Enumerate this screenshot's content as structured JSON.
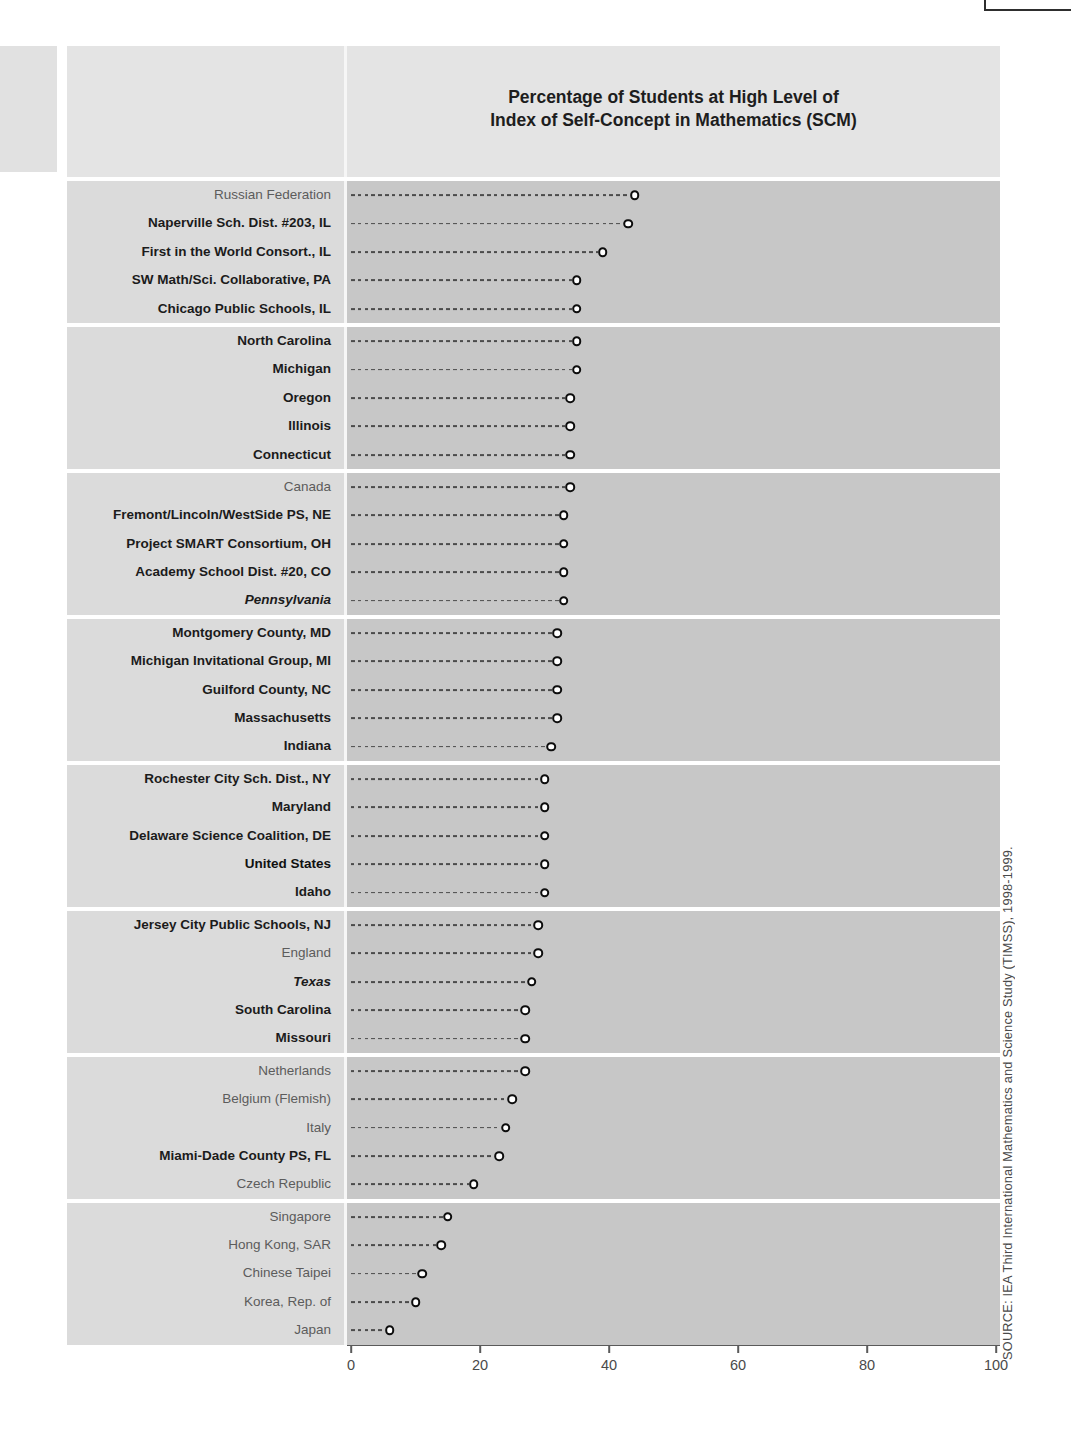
{
  "page": {
    "title_lines": [
      "Percentage of Students at High Level of",
      "Index of Self-Concept in Mathematics (SCM)"
    ],
    "source_note": "SOURCE: IEA Third International Mathematics and Science Study (TIMSS), 1998-1999."
  },
  "colors": {
    "page_background": "#ffffff",
    "title_band": "#e4e4e4",
    "label_column": "#dbdbdb",
    "plot_band": "#c7c7c7",
    "dash_line": "#4b4b4b",
    "marker_ring": "#0d0d0d",
    "marker_fill": "#ffffff",
    "bold_label_text": "#1b1b1b",
    "plain_label_text": "#5c5c5c",
    "axis_text": "#4a4a4a"
  },
  "chart_data": {
    "type": "scatter",
    "variant": "dot-plot",
    "title": "Percentage of Students at High Level of Index of Self-Concept in Mathematics (SCM)",
    "xlabel": "",
    "ylabel": "",
    "xlim": [
      0,
      100
    ],
    "x_ticks": [
      0,
      20,
      40,
      60,
      80,
      100
    ],
    "grid": false,
    "legend": false,
    "groups": [
      {
        "rows": [
          {
            "label": "Russian Federation",
            "value": 44,
            "style": "plain"
          },
          {
            "label": "Naperville Sch. Dist. #203, IL",
            "value": 43,
            "style": "bold"
          },
          {
            "label": "First in the World Consort., IL",
            "value": 39,
            "style": "bold"
          },
          {
            "label": "SW Math/Sci. Collaborative, PA",
            "value": 35,
            "style": "bold"
          },
          {
            "label": "Chicago Public Schools, IL",
            "value": 35,
            "style": "bold"
          }
        ]
      },
      {
        "rows": [
          {
            "label": "North Carolina",
            "value": 35,
            "style": "bold"
          },
          {
            "label": "Michigan",
            "value": 35,
            "style": "bold"
          },
          {
            "label": "Oregon",
            "value": 34,
            "style": "bold"
          },
          {
            "label": "Illinois",
            "value": 34,
            "style": "bold"
          },
          {
            "label": "Connecticut",
            "value": 34,
            "style": "bold"
          }
        ]
      },
      {
        "rows": [
          {
            "label": "Canada",
            "value": 34,
            "style": "plain"
          },
          {
            "label": "Fremont/Lincoln/WestSide PS, NE",
            "value": 33,
            "style": "bold"
          },
          {
            "label": "Project SMART Consortium, OH",
            "value": 33,
            "style": "bold"
          },
          {
            "label": "Academy School Dist. #20, CO",
            "value": 33,
            "style": "bold"
          },
          {
            "label": "Pennsylvania",
            "value": 33,
            "style": "bold-italic"
          }
        ]
      },
      {
        "rows": [
          {
            "label": "Montgomery County, MD",
            "value": 32,
            "style": "bold"
          },
          {
            "label": "Michigan Invitational Group, MI",
            "value": 32,
            "style": "bold"
          },
          {
            "label": "Guilford County, NC",
            "value": 32,
            "style": "bold"
          },
          {
            "label": "Massachusetts",
            "value": 32,
            "style": "bold"
          },
          {
            "label": "Indiana",
            "value": 31,
            "style": "bold"
          }
        ]
      },
      {
        "rows": [
          {
            "label": "Rochester City Sch. Dist., NY",
            "value": 30,
            "style": "bold"
          },
          {
            "label": "Maryland",
            "value": 30,
            "style": "bold"
          },
          {
            "label": "Delaware Science Coalition, DE",
            "value": 30,
            "style": "bold"
          },
          {
            "label": "United States",
            "value": 30,
            "style": "extra-bold"
          },
          {
            "label": "Idaho",
            "value": 30,
            "style": "bold"
          }
        ]
      },
      {
        "rows": [
          {
            "label": "Jersey City Public Schools, NJ",
            "value": 29,
            "style": "bold"
          },
          {
            "label": "England",
            "value": 29,
            "style": "plain"
          },
          {
            "label": "Texas",
            "value": 28,
            "style": "bold-italic"
          },
          {
            "label": "South Carolina",
            "value": 27,
            "style": "bold"
          },
          {
            "label": "Missouri",
            "value": 27,
            "style": "bold"
          }
        ]
      },
      {
        "rows": [
          {
            "label": "Netherlands",
            "value": 27,
            "style": "plain"
          },
          {
            "label": "Belgium (Flemish)",
            "value": 25,
            "style": "plain"
          },
          {
            "label": "Italy",
            "value": 24,
            "style": "plain"
          },
          {
            "label": "Miami-Dade County PS, FL",
            "value": 23,
            "style": "bold"
          },
          {
            "label": "Czech Republic",
            "value": 19,
            "style": "plain"
          }
        ]
      },
      {
        "rows": [
          {
            "label": "Singapore",
            "value": 15,
            "style": "plain"
          },
          {
            "label": "Hong Kong, SAR",
            "value": 14,
            "style": "plain"
          },
          {
            "label": "Chinese Taipei",
            "value": 11,
            "style": "plain"
          },
          {
            "label": "Korea, Rep. of",
            "value": 10,
            "style": "plain"
          },
          {
            "label": "Japan",
            "value": 6,
            "style": "plain"
          }
        ]
      }
    ]
  }
}
